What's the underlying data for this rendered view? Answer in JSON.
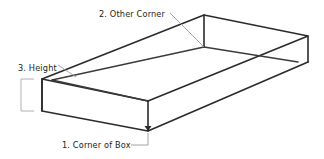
{
  "figure": {
    "background_color": "#ffffff",
    "line_color": "#2b2b2b",
    "leader_color": "#9a9a9a",
    "bracket_color": "#b0b0b0"
  },
  "callouts": {
    "other_corner": {
      "label": "2. Other Corner",
      "number": "2",
      "text_x": 99,
      "text_y": 17
    },
    "height": {
      "label": "3. Height",
      "number": "3",
      "text_x": 18,
      "text_y": 71
    },
    "corner_of_box": {
      "label": "1. Corner of Box",
      "number": "1",
      "text_x": 62,
      "text_y": 148
    }
  },
  "geometry": {
    "outer_top_left": "42,79",
    "outer_top_back": "204,15",
    "outer_top_right": "308,36",
    "outer_top_front": "148,101",
    "outer_bottom_left": "42,111",
    "outer_bottom_front": "148,131",
    "outer_bottom_right": "308,62",
    "inner_corner": "204,47"
  }
}
